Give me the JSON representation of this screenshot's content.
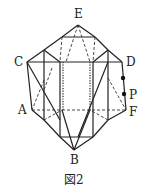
{
  "figure": {
    "caption": "図2",
    "labels": {
      "E": "E",
      "C": "C",
      "D": "D",
      "P": "P",
      "A": "A",
      "F": "F",
      "B": "B"
    },
    "colors": {
      "line": "#222222",
      "background": "#ffffff"
    },
    "points": {
      "E": [
        78,
        25
      ],
      "C": [
        46,
        62
      ],
      "D": [
        122,
        62
      ],
      "A": [
        32,
        110
      ],
      "F": [
        126,
        110
      ],
      "B": [
        74,
        150
      ],
      "P": [
        124,
        94
      ],
      "P_upper_dot": [
        123,
        78
      ]
    }
  }
}
